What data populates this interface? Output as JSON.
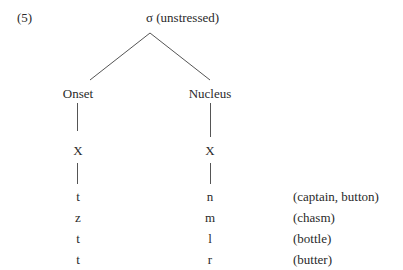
{
  "example_number": "(5)",
  "root": {
    "symbol": "σ",
    "label": "σ (unstressed)",
    "qualifier": "(unstressed)"
  },
  "branches": [
    {
      "label": "Onset",
      "timing_slot": "X",
      "segments": [
        "t",
        "z",
        "t",
        "t"
      ]
    },
    {
      "label": "Nucleus",
      "timing_slot": "X",
      "segments": [
        "n",
        "m",
        "l",
        "r"
      ]
    }
  ],
  "examples": [
    "(captain, button)",
    "(chasm)",
    "(bottle)",
    "(butter)"
  ],
  "rows": [
    {
      "onset": "t",
      "nucleus": "n",
      "example": "(captain, button)"
    },
    {
      "onset": "z",
      "nucleus": "m",
      "example": "(chasm)"
    },
    {
      "onset": "t",
      "nucleus": "l",
      "example": "(bottle)"
    },
    {
      "onset": "t",
      "nucleus": "r",
      "example": "(butter)"
    }
  ],
  "colors": {
    "text": "#2a2a2a",
    "lines": "#555555",
    "background": "#ffffff"
  }
}
